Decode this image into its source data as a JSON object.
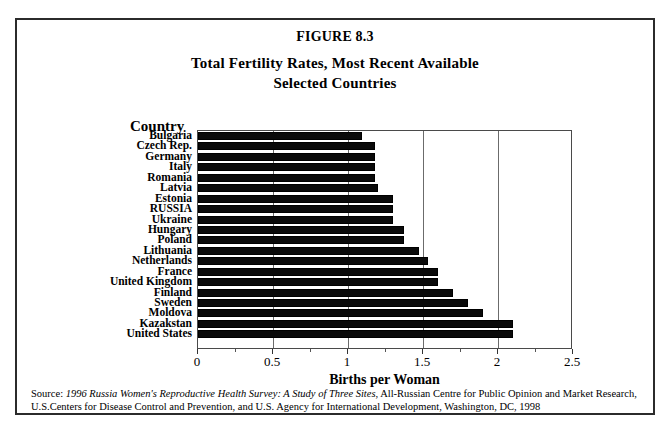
{
  "figure": {
    "number": "FIGURE 8.3",
    "title_line1": "Total Fertility Rates, Most Recent Available",
    "title_line2": "Selected Countries",
    "category_axis_label": "Country",
    "value_axis_label": "Births per Woman"
  },
  "source": {
    "prefix": "Source: ",
    "italic_title": "1996 Russia Women's Reproductive Health Survey: A Study of Three Sites",
    "rest": ", All-Russian Centre for Public Opinion and Market Research, U.S.Centers for Disease Control and Prevention, and U.S. Agency for International Development, Washington, DC, 1998"
  },
  "colors": {
    "bar": "#0a0a0a",
    "frame": "#2b2b2b",
    "gridline": "#6b6b6b",
    "background": "#ffffff"
  },
  "chart_data": {
    "type": "bar",
    "orientation": "horizontal",
    "title": "Total Fertility Rates, Most Recent Available Selected Countries",
    "xlabel": "Births per Woman",
    "ylabel": "Country",
    "xlim": [
      0,
      2.5
    ],
    "xticks": [
      0,
      0.5,
      1,
      1.5,
      2,
      2.5
    ],
    "xticklabels": [
      "0",
      "0.5",
      "1",
      "1.5",
      "2",
      "2.5"
    ],
    "grid": true,
    "legend": false,
    "categories": [
      "Bulgaria",
      "Czech Rep.",
      "Germany",
      "Italy",
      "Romania",
      "Latvia",
      "Estonia",
      "RUSSIA",
      "Ukraine",
      "Hungary",
      "Poland",
      "Lithuania",
      "Netherlands",
      "France",
      "United Kingdom",
      "Finland",
      "Sweden",
      "Moldova",
      "Kazakstan",
      "United States"
    ],
    "values": [
      1.09,
      1.18,
      1.18,
      1.18,
      1.18,
      1.2,
      1.3,
      1.3,
      1.3,
      1.37,
      1.37,
      1.47,
      1.53,
      1.6,
      1.6,
      1.7,
      1.8,
      1.9,
      2.1,
      2.1
    ]
  }
}
